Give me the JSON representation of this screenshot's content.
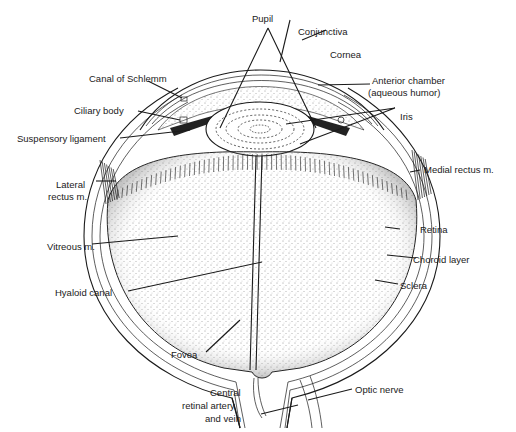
{
  "figure": {
    "colors": {
      "ink": "#1a1a1a",
      "background": "#ffffff"
    }
  },
  "labels": {
    "pupil": "Pupil",
    "conjunctiva": "Conjunctiva",
    "cornea": "Cornea",
    "anterior_chamber": "Anterior chamber",
    "aqueous_humor": "(aqueous humor)",
    "canal_of_schlemm": "Canal of Schlemm",
    "ciliary_body": "Ciliary body",
    "iris": "Iris",
    "suspensory_ligament": "Suspensory ligament",
    "medial_rectus": "Medial rectus m.",
    "lateral_rectus_1": "Lateral",
    "lateral_rectus_2": "rectus m.",
    "retina": "Retina",
    "choroid": "Choroid layer",
    "vitreous": "Vitreous m.",
    "sclera": "Sclera",
    "hyaloid_canal": "Hyaloid canal",
    "fovea": "Fovea",
    "optic_nerve": "Optic nerve",
    "central_artery_1": "Central",
    "central_artery_2": "retinal artery",
    "central_artery_3": "and vein"
  }
}
